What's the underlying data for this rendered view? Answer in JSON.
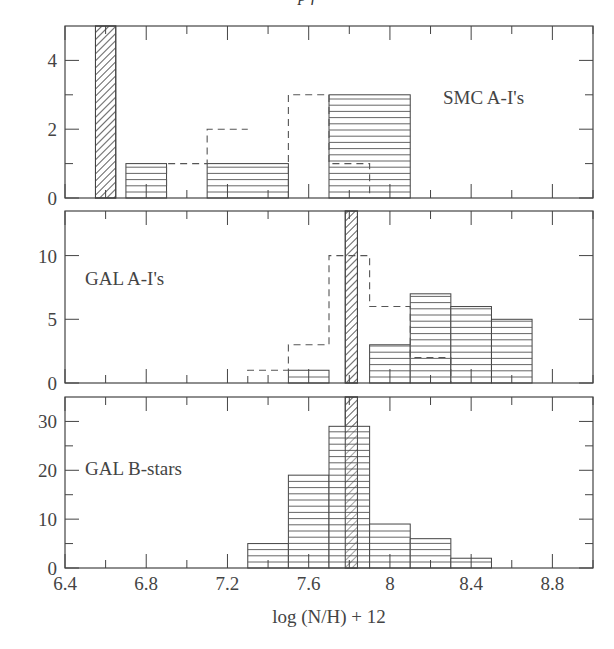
{
  "header": {
    "text": "p f"
  },
  "chart_data": [
    {
      "type": "bar",
      "panel": "top",
      "label": "SMC A-I's",
      "xlim": [
        6.4,
        9.0
      ],
      "ylim": [
        0,
        5
      ],
      "yticks": [
        0,
        2,
        4
      ],
      "yminor": [
        1,
        3
      ],
      "series": [
        {
          "name": "observed (solid hatched)",
          "style": "hlines",
          "bins": [
            [
              6.7,
              6.9,
              1
            ],
            [
              7.1,
              7.5,
              1
            ],
            [
              7.7,
              8.1,
              3
            ]
          ]
        },
        {
          "name": "dashed",
          "style": "dashed",
          "steps": [
            [
              6.9,
              7.1,
              1
            ],
            [
              7.1,
              7.3,
              2
            ],
            [
              7.5,
              7.7,
              3
            ],
            [
              7.7,
              7.9,
              1
            ]
          ]
        }
      ],
      "band": {
        "x0": 6.55,
        "x1": 6.65,
        "style": "diagonal"
      }
    },
    {
      "type": "bar",
      "panel": "middle",
      "label": "GAL A-I's",
      "xlim": [
        6.4,
        9.0
      ],
      "ylim": [
        0,
        13.5
      ],
      "yticks": [
        0,
        5,
        10
      ],
      "yminor": [],
      "series": [
        {
          "name": "observed (solid hatched)",
          "style": "hlines",
          "bins": [
            [
              7.5,
              7.7,
              1
            ],
            [
              7.9,
              8.1,
              3
            ],
            [
              8.1,
              8.3,
              7
            ],
            [
              8.3,
              8.5,
              6
            ],
            [
              8.5,
              8.7,
              5
            ]
          ]
        },
        {
          "name": "dashed",
          "style": "dashed",
          "steps": [
            [
              7.3,
              7.5,
              1
            ],
            [
              7.5,
              7.7,
              3
            ],
            [
              7.7,
              7.9,
              10
            ],
            [
              7.9,
              8.1,
              6
            ],
            [
              8.1,
              8.3,
              2
            ]
          ]
        }
      ],
      "band": {
        "x0": 7.78,
        "x1": 7.84,
        "style": "diagonal"
      }
    },
    {
      "type": "bar",
      "panel": "bottom",
      "label": "GAL B-stars",
      "xlim": [
        6.4,
        9.0
      ],
      "ylim": [
        0,
        35
      ],
      "yticks": [
        0,
        10,
        20,
        30
      ],
      "yminor": [
        5,
        15,
        25
      ],
      "series": [
        {
          "name": "observed (solid hatched)",
          "style": "hlines",
          "bins": [
            [
              7.3,
              7.5,
              5
            ],
            [
              7.5,
              7.7,
              19
            ],
            [
              7.7,
              7.9,
              29
            ],
            [
              7.9,
              8.1,
              9
            ],
            [
              8.1,
              8.3,
              6
            ],
            [
              8.3,
              8.5,
              2
            ]
          ]
        }
      ],
      "band": {
        "x0": 7.78,
        "x1": 7.84,
        "style": "diagonal"
      }
    }
  ],
  "xaxis": {
    "label": "log (N/H) + 12",
    "ticks": [
      6.4,
      6.8,
      7.2,
      7.6,
      8.0,
      8.4,
      8.8
    ],
    "tick_labels": [
      "6.4",
      "6.8",
      "7.2",
      "7.6",
      "8",
      "8.4",
      "8.8"
    ],
    "minor": [
      6.6,
      7.0,
      7.4,
      7.8,
      8.2,
      8.6,
      9.0
    ]
  }
}
